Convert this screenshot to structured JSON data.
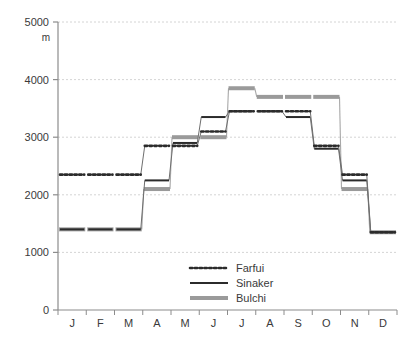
{
  "chart_data": {
    "type": "line",
    "title": "",
    "subtitle": "",
    "xlabel": "",
    "ylabel": "m",
    "ylim": [
      0,
      5000
    ],
    "ytick_labels": [
      "0",
      "1000",
      "2000",
      "3000",
      "4000",
      "5000"
    ],
    "yticks": [
      0,
      1000,
      2000,
      3000,
      4000,
      5000
    ],
    "grid": true,
    "grid_axis": "y",
    "legend_position": "bottom-center",
    "categories": [
      "J",
      "F",
      "M",
      "A",
      "M",
      "J",
      "J",
      "A",
      "S",
      "O",
      "N",
      "D"
    ],
    "x_tick_labels": [
      "J",
      "F",
      "M",
      "A",
      "M",
      "J",
      "J",
      "A",
      "S",
      "O",
      "N",
      "D"
    ],
    "step_style": "month-step",
    "series": [
      {
        "name": "Farfui",
        "style": "dotted",
        "color": "#2b2b2b",
        "values": [
          2350,
          2350,
          2350,
          2850,
          2850,
          3100,
          3450,
          3450,
          3450,
          2850,
          2350,
          1350
        ]
      },
      {
        "name": "Sinaker",
        "style": "solid",
        "color": "#2b2b2b",
        "values": [
          1400,
          1400,
          1400,
          2250,
          2900,
          3350,
          3450,
          3450,
          3350,
          2800,
          2250,
          1350
        ]
      },
      {
        "name": "Bulchi",
        "style": "thick",
        "color": "#9a9a9a",
        "values": [
          1400,
          1400,
          1400,
          2100,
          3000,
          3000,
          3850,
          3700,
          3700,
          3700,
          2100,
          1350
        ]
      }
    ]
  },
  "legend": {
    "entries": [
      {
        "label": "Farfui",
        "swatch": "dotted-line-swatch"
      },
      {
        "label": "Sinaker",
        "swatch": "solid-line-swatch"
      },
      {
        "label": "Bulchi",
        "swatch": "thick-gray-line-swatch"
      }
    ]
  },
  "axis": {
    "y_unit": "m",
    "axis_color": "#8c8c8c",
    "grid_color": "#c9c9c9"
  }
}
